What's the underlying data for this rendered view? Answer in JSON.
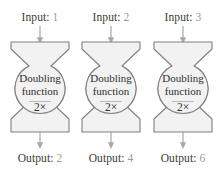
{
  "diagram": {
    "colors": {
      "shape_fill": "#f2f2f2",
      "shape_stroke": "#808080",
      "arrow": "#a8a8a8",
      "label_text": "#3a3a3a",
      "value_text": "#9a9a9a",
      "body_text": "#2e2e2e",
      "background": "#ffffff"
    },
    "machines": [
      {
        "input_label": "Input:",
        "input_value": "1",
        "name_line1": "Doubling",
        "name_line2": "function",
        "operation": "2×",
        "output_label": "Output:",
        "output_value": "2",
        "in_arrow_icon": "arrow-down-icon",
        "out_arrow_icon": "arrow-down-icon",
        "shape_icon": "funnel-machine-icon"
      },
      {
        "input_label": "Input:",
        "input_value": "2",
        "name_line1": "Doubling",
        "name_line2": "function",
        "operation": "2×",
        "output_label": "Output:",
        "output_value": "4",
        "in_arrow_icon": "arrow-down-icon",
        "out_arrow_icon": "arrow-down-icon",
        "shape_icon": "funnel-machine-icon"
      },
      {
        "input_label": "Input:",
        "input_value": "3",
        "name_line1": "Doubling",
        "name_line2": "function",
        "operation": "2×",
        "output_label": "Output:",
        "output_value": "6",
        "in_arrow_icon": "arrow-down-icon",
        "out_arrow_icon": "arrow-down-icon",
        "shape_icon": "funnel-machine-icon"
      }
    ]
  }
}
